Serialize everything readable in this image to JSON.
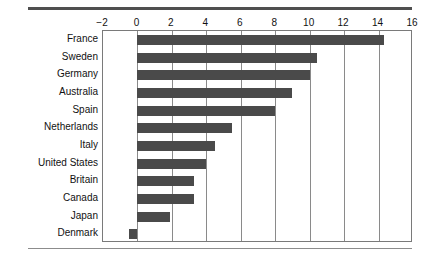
{
  "chart_data": {
    "type": "bar",
    "orientation": "horizontal",
    "title": "",
    "subtitle": "",
    "xlabel": "",
    "ylabel": "",
    "categories": [
      "France",
      "Sweden",
      "Germany",
      "Australia",
      "Spain",
      "Netherlands",
      "Italy",
      "United States",
      "Britain",
      "Canada",
      "Japan",
      "Denmark"
    ],
    "values": [
      14.3,
      10.4,
      10.0,
      9.0,
      8.0,
      5.5,
      4.5,
      4.0,
      3.3,
      3.3,
      1.9,
      -0.5
    ],
    "series": [
      {
        "name": "value",
        "values": [
          14.3,
          10.4,
          10.0,
          9.0,
          8.0,
          5.5,
          4.5,
          4.0,
          3.3,
          3.3,
          1.9,
          -0.5
        ]
      }
    ],
    "xlim": [
      -2,
      16
    ],
    "xticks": [
      -2,
      0,
      2,
      4,
      6,
      8,
      10,
      12,
      14,
      16
    ],
    "xtick_labels": [
      "−2",
      "0",
      "2",
      "4",
      "6",
      "8",
      "10",
      "12",
      "14",
      "16"
    ],
    "grid": "vertical",
    "legend": "none",
    "bar_color": "#4a4a4a",
    "axis_color": "#7a7a7a",
    "gridline_color": "#8a8a8a",
    "background": "#ffffff"
  }
}
